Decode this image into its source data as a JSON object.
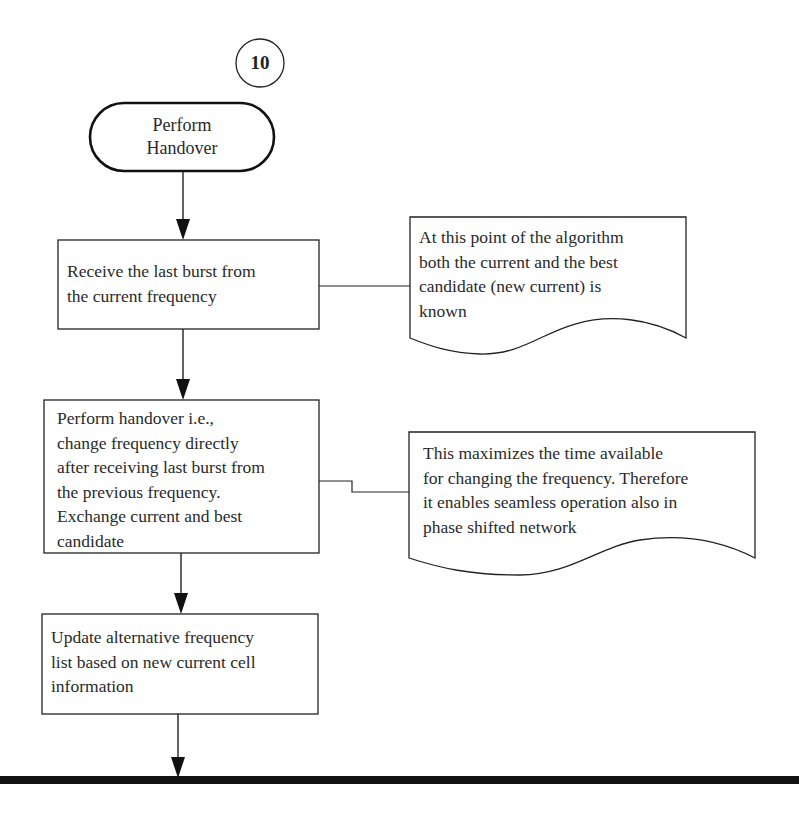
{
  "connector_label": "10",
  "terminal": {
    "line1": "Perform",
    "line2": "Handover"
  },
  "steps": [
    {
      "lines": [
        "Receive the last burst from",
        "the current frequency"
      ]
    },
    {
      "lines": [
        "Perform handover i.e.,",
        "change frequency directly",
        "after receiving last burst from",
        "the previous frequency.",
        "Exchange current and best",
        "candidate"
      ]
    },
    {
      "lines": [
        "Update alternative frequency",
        "list based on new current cell",
        "information"
      ]
    }
  ],
  "notes": [
    {
      "lines": [
        "At this point of the algorithm",
        "both the current and the best",
        "candidate (new current) is",
        "known"
      ]
    },
    {
      "lines": [
        "This maximizes the time available",
        "for changing the frequency. Therefore",
        "it enables seamless operation also in",
        "phase shifted network"
      ]
    }
  ],
  "colors": {
    "stroke": "#222222",
    "background": "#ffffff",
    "bar": "#111111"
  }
}
